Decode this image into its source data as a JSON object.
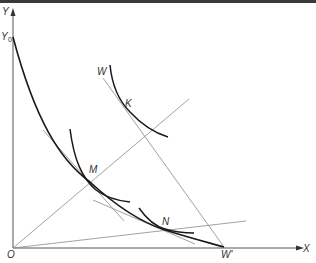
{
  "diagram": {
    "type": "economics-indifference-curve-diagram",
    "axes": {
      "x_label": "X",
      "y_label": "Y",
      "origin_label": "O",
      "y_intercept_label": "Y",
      "y_intercept_subscript": "0",
      "x_intercept_label": "W'"
    },
    "points": [
      {
        "label": "M"
      },
      {
        "label": "N"
      },
      {
        "label": "K"
      }
    ],
    "line_labels": {
      "budget_line_start": "W"
    },
    "colors": {
      "curve": "#1a1a1a",
      "thin_line": "#8a8a8a",
      "axis": "#555555",
      "background": "#ffffff"
    }
  }
}
